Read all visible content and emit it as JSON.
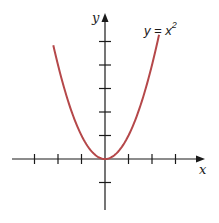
{
  "chart_data": {
    "type": "line",
    "title": "",
    "function": "y = x^2",
    "annotation": {
      "text": "y = x",
      "superscript": "2"
    },
    "xlabel": "x",
    "ylabel": "y",
    "series": [
      {
        "name": "y = x^2",
        "color": "#b5484a",
        "x": [
          -2.2,
          -2.0,
          -1.5,
          -1.0,
          -0.5,
          0,
          0.5,
          1.0,
          1.5,
          2.0,
          2.3
        ],
        "values": [
          4.84,
          4.0,
          2.25,
          1.0,
          0.25,
          0,
          0.25,
          1.0,
          2.25,
          4.0,
          5.29
        ]
      }
    ],
    "xlim": [
      -4,
      4.3
    ],
    "ylim": [
      -2.3,
      6.2
    ],
    "x_ticks": [
      -3,
      -2,
      -1,
      1,
      2,
      3
    ],
    "y_ticks": [
      -1,
      1,
      2,
      3,
      4,
      5
    ],
    "tick_labels_shown": false,
    "grid": false,
    "legend": "none"
  },
  "style": {
    "axis_color": "#1a1a1a",
    "curve_color": "#b5484a"
  }
}
